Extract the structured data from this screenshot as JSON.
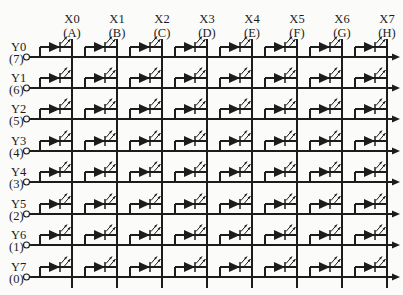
{
  "diagram": {
    "background_color": "#fbfbf9",
    "line_color": "#1c1c1c",
    "cell_symbol": "led",
    "columns": [
      {
        "label": "X0",
        "pin": "(A)"
      },
      {
        "label": "X1",
        "pin": "(B)"
      },
      {
        "label": "X2",
        "pin": "(C)"
      },
      {
        "label": "X3",
        "pin": "(D)"
      },
      {
        "label": "X4",
        "pin": "(E)"
      },
      {
        "label": "X5",
        "pin": "(F)"
      },
      {
        "label": "X6",
        "pin": "(G)"
      },
      {
        "label": "X7",
        "pin": "(H)"
      }
    ],
    "rows": [
      {
        "label": "Y0",
        "pin": "(7)"
      },
      {
        "label": "Y1",
        "pin": "(6)"
      },
      {
        "label": "Y2",
        "pin": "(5)"
      },
      {
        "label": "Y3",
        "pin": "(4)"
      },
      {
        "label": "Y4",
        "pin": "(3)"
      },
      {
        "label": "Y5",
        "pin": "(2)"
      },
      {
        "label": "Y6",
        "pin": "(1)"
      },
      {
        "label": "Y7",
        "pin": "(0)"
      }
    ]
  }
}
